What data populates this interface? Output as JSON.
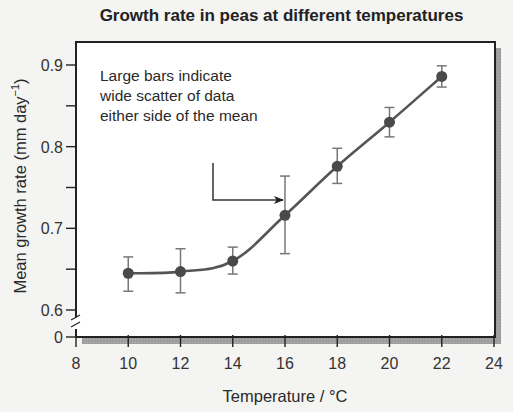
{
  "chart_data": {
    "type": "line",
    "title": "Growth rate in peas at different temperatures",
    "xlabel": "Temperature / °C",
    "ylabel": "Mean growth rate (mm day",
    "ylabel_superscript": "−1",
    "ylabel_suffix": ")",
    "xlim": [
      8,
      24
    ],
    "ylim": [
      0.6,
      0.9
    ],
    "y_axis_break": true,
    "x_ticks": [
      8,
      10,
      12,
      14,
      16,
      18,
      20,
      22,
      24
    ],
    "x_tick_labels": [
      "8",
      "10",
      "12",
      "14",
      "16",
      "18",
      "20",
      "22",
      "24"
    ],
    "y_ticks": [
      0.6,
      0.7,
      0.8,
      0.9
    ],
    "y_tick_labels": [
      "0.6",
      "0.7",
      "0.8",
      "0.9"
    ],
    "y_minor_ticks": [
      0.65,
      0.75,
      0.85
    ],
    "y_zero_label": "0",
    "grid": false,
    "legend": null,
    "series": [
      {
        "name": "Mean growth rate",
        "x": [
          10,
          12,
          14,
          16,
          18,
          20,
          22
        ],
        "y": [
          0.645,
          0.647,
          0.66,
          0.716,
          0.776,
          0.83,
          0.886
        ],
        "error_upper": [
          0.665,
          0.675,
          0.677,
          0.764,
          0.798,
          0.848,
          0.899
        ],
        "error_lower": [
          0.623,
          0.621,
          0.644,
          0.669,
          0.755,
          0.812,
          0.873
        ],
        "color": "#555555"
      }
    ],
    "annotations": [
      {
        "text_lines": [
          "Large bars indicate",
          "wide scatter of data",
          "either side of the mean"
        ],
        "arrow_target_x": 16
      }
    ]
  },
  "colors": {
    "background": "#f4f4f2",
    "plot_background": "#ffffff",
    "frame": "#222222",
    "shadow": "#9a9a9a",
    "line": "#555555",
    "marker": "#4a4a4a",
    "error_bar": "#777777"
  }
}
